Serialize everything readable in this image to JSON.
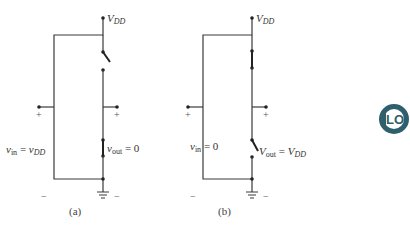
{
  "figure": {
    "panels": [
      {
        "id": "a",
        "caption": "(a)",
        "supply_label": "V",
        "supply_sub": "DD",
        "input_label_v": "v",
        "input_label_sub": "in",
        "input_eq": " = ",
        "input_value_v": "v",
        "input_value_sub": "DD",
        "output_label_v": "v",
        "output_label_sub": "out",
        "output_eq": " = ",
        "output_value": "0",
        "plus_left": "+",
        "plus_right": "+",
        "minus_left": "−",
        "minus_right": "−",
        "pullup_switch": "open",
        "pulldown_switch": "closed"
      },
      {
        "id": "b",
        "caption": "(b)",
        "supply_label": "V",
        "supply_sub": "DD",
        "input_label_v": "v",
        "input_label_sub": "in",
        "input_eq": " = ",
        "input_value": "0",
        "output_label_v": "V",
        "output_label_sub": "out",
        "output_eq": " = ",
        "output_value_v": "V",
        "output_value_sub": "DD",
        "plus_left": "+",
        "plus_right": "+",
        "minus_left": "−",
        "minus_right": "−",
        "pullup_switch": "closed",
        "pulldown_switch": "open"
      }
    ],
    "logo": {
      "text": "LO",
      "color": "#2f5f6b"
    }
  }
}
